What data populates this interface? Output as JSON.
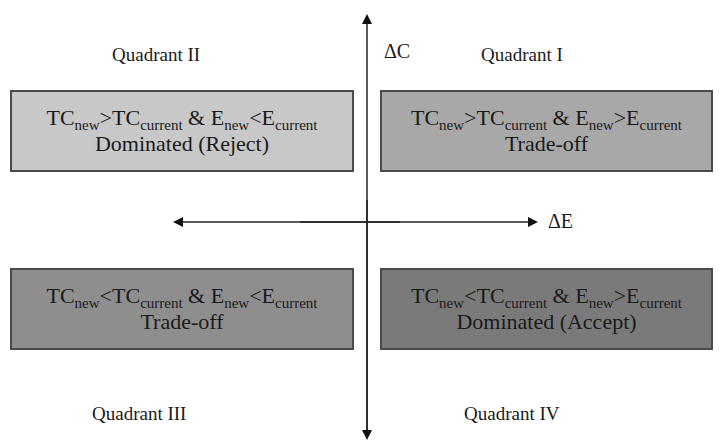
{
  "diagram": {
    "type": "quadrant",
    "axes": {
      "vertical_label": "ΔC",
      "horizontal_label": "ΔE"
    },
    "quadrants": [
      {
        "id": "II",
        "label": "Quadrant II",
        "condition": {
          "tc_sub": "new",
          "tc_op": ">",
          "tc_sub2": "current",
          "e_sub": "new",
          "e_op": "<",
          "e_sub2": "current",
          "amp": "&"
        },
        "outcome": "Dominated (Reject)",
        "fill": "#c8c8c8"
      },
      {
        "id": "I",
        "label": "Quadrant I",
        "condition": {
          "tc_sub": "new",
          "tc_op": ">",
          "tc_sub2": "current",
          "e_sub": "new",
          "e_op": ">",
          "e_sub2": "current",
          "amp": "&"
        },
        "outcome": "Trade-off",
        "fill": "#a8a8a8"
      },
      {
        "id": "III",
        "label": "Quadrant III",
        "condition": {
          "tc_sub": "new",
          "tc_op": "<",
          "tc_sub2": "current",
          "e_sub": "new",
          "e_op": "<",
          "e_sub2": "current",
          "amp": "&"
        },
        "outcome": "Trade-off",
        "fill": "#8e8e8e"
      },
      {
        "id": "IV",
        "label": "Quadrant IV",
        "condition": {
          "tc_sub": "new",
          "tc_op": "<",
          "tc_sub2": "current",
          "e_sub": "new",
          "e_op": ">",
          "e_sub2": "current",
          "amp": "&"
        },
        "outcome": "Dominated (Accept)",
        "fill": "#7a7a7a"
      }
    ],
    "symbols": {
      "tc": "TC",
      "e": "E"
    }
  }
}
